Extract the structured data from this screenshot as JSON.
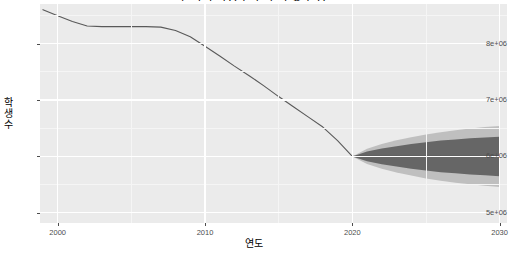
{
  "chart_data": {
    "type": "line",
    "title": "한국의 학령 인구 추이 및 전망",
    "xlabel": "연도",
    "ylabel": "학생수",
    "xlim": [
      1998.8,
      2030.5
    ],
    "ylim": [
      4820000,
      8700000
    ],
    "xticks": [
      2000,
      2010,
      2020,
      2030
    ],
    "xtick_labels": [
      "2000",
      "2010",
      "2020",
      "2030"
    ],
    "yticks": [
      5000000,
      6000000,
      7000000,
      8000000
    ],
    "ytick_labels": [
      "5e+06",
      "6e+06",
      "7e+06",
      "8e+06"
    ],
    "grid": true,
    "legend": "none",
    "series": [
      {
        "name": "historical",
        "kind": "line",
        "color": "#595959",
        "x": [
          1999,
          2000,
          2001,
          2002,
          2003,
          2004,
          2005,
          2006,
          2007,
          2008,
          2009,
          2010,
          2011,
          2012,
          2013,
          2014,
          2015,
          2016,
          2017,
          2018,
          2019,
          2020
        ],
        "y": [
          8600000,
          8490000,
          8390000,
          8310000,
          8300000,
          8300000,
          8300000,
          8300000,
          8290000,
          8230000,
          8120000,
          7950000,
          7780000,
          7600000,
          7430000,
          7250000,
          7060000,
          6880000,
          6700000,
          6520000,
          6280000,
          6000000
        ]
      },
      {
        "name": "forecast-mean",
        "kind": "line",
        "color": "#333333",
        "x": [
          2020,
          2021,
          2022,
          2023,
          2024,
          2025,
          2026,
          2027,
          2028,
          2029,
          2030
        ],
        "y": [
          6000000,
          6000000,
          6000000,
          6000000,
          6000000,
          6000000,
          6000000,
          6000000,
          6000000,
          6000000,
          6000000
        ]
      },
      {
        "name": "interval-80",
        "kind": "band",
        "color": "#666666",
        "level": 80,
        "x": [
          2020,
          2021,
          2022,
          2023,
          2024,
          2025,
          2026,
          2027,
          2028,
          2029,
          2030
        ],
        "lower": [
          6000000,
          5915000,
          5860000,
          5820000,
          5780000,
          5750000,
          5720000,
          5700000,
          5680000,
          5665000,
          5650000
        ],
        "upper": [
          6000000,
          6085000,
          6140000,
          6180000,
          6220000,
          6250000,
          6280000,
          6300000,
          6320000,
          6335000,
          6350000
        ]
      },
      {
        "name": "interval-95",
        "kind": "band",
        "color": "#BFBFBF",
        "level": 95,
        "x": [
          2020,
          2021,
          2022,
          2023,
          2024,
          2025,
          2026,
          2027,
          2028,
          2029,
          2030
        ],
        "lower": [
          6000000,
          5865000,
          5780000,
          5715000,
          5660000,
          5610000,
          5570000,
          5535000,
          5505000,
          5480000,
          5460000
        ],
        "upper": [
          6000000,
          6135000,
          6220000,
          6285000,
          6340000,
          6390000,
          6430000,
          6465000,
          6495000,
          6520000,
          6540000
        ]
      }
    ]
  },
  "theme": {
    "panel_background": "#EBEBEB",
    "gridline_major": "#FFFFFF",
    "gridline_minor": "#F5F5F5",
    "axis_text": "#4D4D4D",
    "plot_background": "#FFFFFF"
  }
}
